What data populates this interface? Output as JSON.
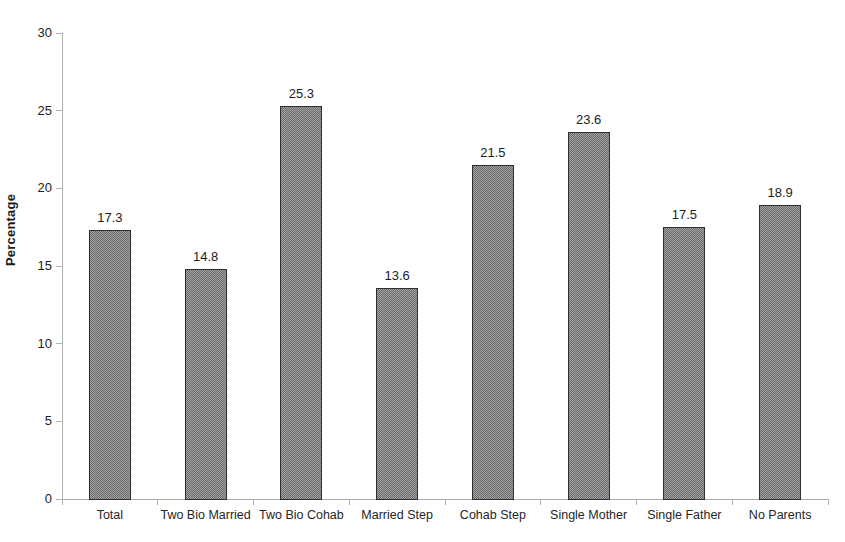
{
  "chart_data": {
    "type": "bar",
    "title": "",
    "xlabel": "",
    "ylabel": "Percentage",
    "categories": [
      "Total",
      "Two Bio Married",
      "Two Bio Cohab",
      "Married Step",
      "Cohab Step",
      "Single Mother",
      "Single Father",
      "No Parents"
    ],
    "values": [
      17.3,
      14.8,
      25.3,
      13.6,
      21.5,
      23.6,
      17.5,
      18.9
    ],
    "value_labels": [
      "17.3",
      "14.8",
      "25.3",
      "13.6",
      "21.5",
      "23.6",
      "17.5",
      "18.9"
    ],
    "ylim": [
      0,
      30
    ],
    "yticks": [
      0,
      5,
      10,
      15,
      20,
      25,
      30
    ],
    "grid": false,
    "legend": null,
    "colors": {
      "bar_fill": "#8a8a8a",
      "bar_pattern_dark": "#6b6b6b",
      "bar_pattern_light": "#a2a2a2",
      "bar_border": "#2e2e2e",
      "axis": "#b0b0b0",
      "text": "#1c1c1c",
      "background": "#ffffff"
    }
  }
}
